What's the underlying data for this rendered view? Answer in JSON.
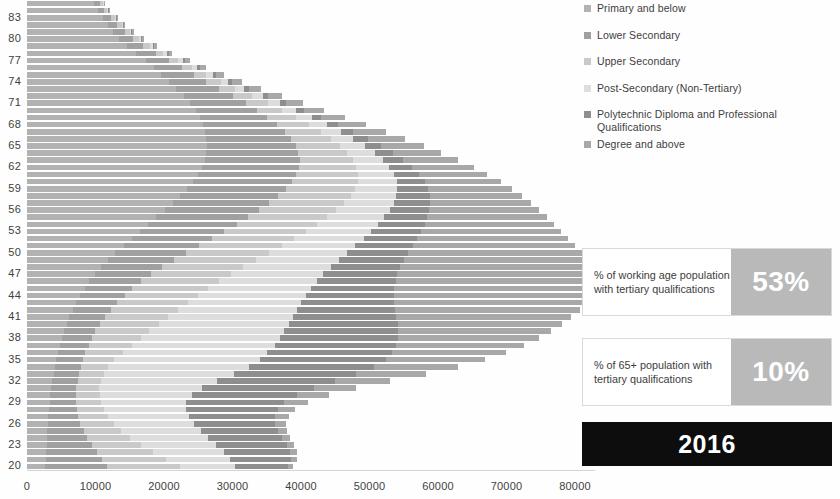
{
  "legend": {
    "position": "right",
    "items": [
      {
        "label": "Primary and below",
        "color": "#b2b2b2",
        "icon": "square-swatch-icon"
      },
      {
        "label": "Lower Secondary",
        "color": "#a0a0a0",
        "icon": "square-swatch-icon"
      },
      {
        "label": "Upper Secondary",
        "color": "#c9c9c9",
        "icon": "square-swatch-icon"
      },
      {
        "label": "Post-Secondary (Non-Tertiary)",
        "color": "#dddddd",
        "icon": "square-swatch-icon"
      },
      {
        "label": "Polytechnic Diploma and Professional Qualifications",
        "color": "#8e8e8e",
        "icon": "square-swatch-icon"
      },
      {
        "label": "Degree and above",
        "color": "#a8a8a8",
        "icon": "square-swatch-icon"
      }
    ]
  },
  "callouts": [
    {
      "label": "% of working age population with tertiary qualifications",
      "value": "53%"
    },
    {
      "label": "% of 65+ population with tertiary qualifications",
      "value": "10%"
    }
  ],
  "year_badge": "2016",
  "chart_data": {
    "type": "bar",
    "orientation": "horizontal",
    "stacked": true,
    "title": "",
    "subtitle": "",
    "xlabel": "",
    "ylabel": "",
    "xlim": [
      0,
      80000
    ],
    "xticks": [
      0,
      10000,
      20000,
      30000,
      40000,
      50000,
      60000,
      70000,
      80000
    ],
    "xtick_labels": [
      "0",
      "10000",
      "20000",
      "30000",
      "40000",
      "50000",
      "60000",
      "70000",
      "80000"
    ],
    "grid": false,
    "legend_position": "right",
    "ytick_labels": [
      "83",
      "80",
      "77",
      "74",
      "71",
      "68",
      "65",
      "62",
      "59",
      "56",
      "53",
      "50",
      "47",
      "44",
      "41",
      "38",
      "35",
      "32",
      "29",
      "26",
      "23",
      "20"
    ],
    "ytick_ages": [
      83,
      80,
      77,
      74,
      71,
      68,
      65,
      62,
      59,
      56,
      53,
      50,
      47,
      44,
      41,
      38,
      35,
      32,
      29,
      26,
      23,
      20
    ],
    "categories": [
      85,
      84,
      83,
      82,
      81,
      80,
      79,
      78,
      77,
      76,
      75,
      74,
      73,
      72,
      71,
      70,
      69,
      68,
      67,
      66,
      65,
      64,
      63,
      62,
      61,
      60,
      59,
      58,
      57,
      56,
      55,
      54,
      53,
      52,
      51,
      50,
      49,
      48,
      47,
      46,
      45,
      44,
      43,
      42,
      41,
      40,
      39,
      38,
      37,
      36,
      35,
      34,
      33,
      32,
      31,
      30,
      29,
      28,
      27,
      26,
      25,
      24,
      23,
      22,
      21,
      20
    ],
    "series": [
      {
        "name": "Primary and below",
        "color": "#b2b2b2",
        "values": [
          9800,
          10300,
          11100,
          11800,
          12600,
          13500,
          14600,
          15900,
          17300,
          18500,
          19600,
          20700,
          21700,
          22900,
          23800,
          24600,
          25200,
          25700,
          26000,
          26200,
          26300,
          26200,
          26000,
          25600,
          25000,
          24300,
          23400,
          22400,
          21300,
          20100,
          18900,
          17700,
          16500,
          15300,
          14100,
          12900,
          11800,
          10800,
          9900,
          9100,
          8400,
          7800,
          7200,
          6700,
          6200,
          5800,
          5400,
          5100,
          4800,
          4500,
          4300,
          4100,
          3900,
          3700,
          3500,
          3400,
          3300,
          3200,
          3100,
          3000,
          2950,
          2900,
          2850,
          2800,
          2750,
          2700
        ]
      },
      {
        "name": "Lower Secondary",
        "color": "#a0a0a0",
        "values": [
          900,
          1000,
          1200,
          1400,
          1700,
          2000,
          2400,
          2900,
          3500,
          4100,
          4800,
          5500,
          6300,
          7200,
          8100,
          9000,
          9900,
          10800,
          11600,
          12300,
          12900,
          13400,
          13800,
          14100,
          14300,
          14400,
          14400,
          14300,
          14100,
          13800,
          13400,
          12900,
          12300,
          11700,
          11000,
          10300,
          9600,
          8900,
          8200,
          7600,
          7000,
          6500,
          6000,
          5600,
          5200,
          4900,
          4600,
          4400,
          4200,
          4000,
          3900,
          3800,
          3700,
          3700,
          3700,
          3800,
          3900,
          4100,
          4400,
          4800,
          5300,
          5900,
          6600,
          7400,
          8200,
          9000
        ]
      },
      {
        "name": "Upper Secondary",
        "color": "#c9c9c9",
        "values": [
          400,
          450,
          520,
          600,
          700,
          820,
          960,
          1120,
          1300,
          1520,
          1780,
          2080,
          2420,
          2800,
          3220,
          3680,
          4180,
          4720,
          5300,
          5900,
          6520,
          7150,
          7780,
          8400,
          9000,
          9560,
          10080,
          10540,
          10940,
          11280,
          11560,
          11780,
          11940,
          12040,
          12080,
          12060,
          11980,
          11840,
          11640,
          11380,
          11060,
          10680,
          10240,
          9740,
          9180,
          8560,
          7880,
          7140,
          6340,
          5480,
          4560,
          3960,
          3600,
          3400,
          3340,
          3400,
          3580,
          3880,
          4300,
          4840,
          5500,
          6280,
          7180,
          8200,
          9340,
          10600
        ]
      },
      {
        "name": "Post-Secondary (Non-Tertiary)",
        "color": "#dddddd",
        "values": [
          120,
          140,
          170,
          210,
          260,
          320,
          400,
          500,
          620,
          760,
          920,
          1100,
          1300,
          1520,
          1760,
          2020,
          2300,
          2600,
          2920,
          3260,
          3620,
          4000,
          4400,
          4820,
          5260,
          5720,
          6200,
          6700,
          7220,
          7760,
          8320,
          8900,
          9500,
          10120,
          10760,
          11420,
          12100,
          12800,
          13520,
          14260,
          15020,
          15800,
          16600,
          17400,
          18200,
          19000,
          19700,
          20300,
          20800,
          21100,
          21200,
          20500,
          19000,
          17000,
          15000,
          13500,
          12500,
          12000,
          11800,
          11700,
          11600,
          11400,
          11000,
          10300,
          9300,
          8000
        ]
      },
      {
        "name": "Polytechnic Diploma and Professional Qualifications",
        "color": "#8e8e8e",
        "values": [
          60,
          70,
          85,
          105,
          130,
          160,
          200,
          250,
          310,
          380,
          470,
          570,
          690,
          830,
          990,
          1170,
          1370,
          1590,
          1830,
          2090,
          2370,
          2670,
          2990,
          3330,
          3690,
          4070,
          4470,
          4890,
          5330,
          5790,
          6270,
          6770,
          7290,
          7830,
          8390,
          8970,
          9570,
          10190,
          10830,
          11490,
          12170,
          12870,
          13590,
          14330,
          15090,
          15870,
          16600,
          17250,
          17800,
          18200,
          18400,
          18300,
          17900,
          17200,
          16300,
          15300,
          14300,
          13400,
          12600,
          11900,
          11300,
          10800,
          10300,
          9700,
          8900,
          7800
        ]
      },
      {
        "name": "Degree and above",
        "color": "#a8a8a8",
        "values": [
          120,
          140,
          175,
          220,
          280,
          350,
          450,
          570,
          720,
          900,
          1120,
          1380,
          1690,
          2050,
          2460,
          2930,
          3460,
          4050,
          4700,
          5420,
          6200,
          7050,
          7960,
          8940,
          9980,
          11080,
          12240,
          13460,
          14740,
          16080,
          17480,
          18940,
          20460,
          22040,
          23680,
          25380,
          26900,
          28100,
          28900,
          29300,
          29300,
          28900,
          28100,
          27000,
          25600,
          24000,
          22300,
          20500,
          18600,
          16600,
          14500,
          12300,
          10100,
          8000,
          6200,
          4700,
          3500,
          2600,
          2000,
          1600,
          1350,
          1180,
          1050,
          950,
          870,
          800
        ]
      }
    ]
  }
}
